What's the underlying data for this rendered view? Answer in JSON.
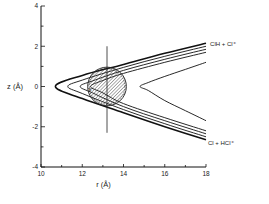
{
  "chart_data": {
    "type": "line",
    "title": "",
    "xlabel": "r (Å)",
    "ylabel": "z (Å)",
    "xlim": [
      10,
      18
    ],
    "ylim": [
      -4,
      4
    ],
    "grid": false,
    "x_ticks": [
      10,
      12,
      14,
      16,
      18
    ],
    "x_tick_labels": [
      "10",
      "12",
      "14",
      "16",
      "18"
    ],
    "x_minor_ticks": [
      11,
      13,
      15,
      17
    ],
    "y_ticks": [
      4,
      2,
      0,
      -2,
      -4
    ],
    "y_tick_labels": [
      "4",
      "2",
      "0",
      "-2",
      "-4"
    ],
    "y_minor_ticks": [
      3,
      1,
      -1,
      -3
    ],
    "series": [
      {
        "name": "contour-1",
        "tip_r": 10.7,
        "upper": [
          [
            10.7,
            0
          ],
          [
            12,
            0.55
          ],
          [
            14,
            1.1
          ],
          [
            16,
            1.65
          ],
          [
            18,
            2.15
          ]
        ],
        "lower": [
          [
            10.7,
            0
          ],
          [
            12,
            -0.6
          ],
          [
            14,
            -1.3
          ],
          [
            16,
            -2.0
          ],
          [
            18,
            -2.65
          ]
        ]
      },
      {
        "name": "contour-2",
        "tip_r": 11.3,
        "upper": [
          [
            11.3,
            0
          ],
          [
            12,
            0.32
          ],
          [
            14,
            0.95
          ],
          [
            16,
            1.5
          ],
          [
            18,
            2.0
          ]
        ],
        "lower": [
          [
            11.3,
            0
          ],
          [
            12,
            -0.35
          ],
          [
            14,
            -1.15
          ],
          [
            16,
            -1.85
          ],
          [
            18,
            -2.5
          ]
        ]
      },
      {
        "name": "contour-3",
        "tip_r": 11.9,
        "upper": [
          [
            11.9,
            0
          ],
          [
            12.5,
            0.28
          ],
          [
            14,
            0.8
          ],
          [
            16,
            1.35
          ],
          [
            18,
            1.85
          ]
        ],
        "lower": [
          [
            11.9,
            0
          ],
          [
            12.5,
            -0.32
          ],
          [
            14,
            -1.0
          ],
          [
            16,
            -1.7
          ],
          [
            18,
            -2.35
          ]
        ]
      },
      {
        "name": "contour-4",
        "tip_r": 12.4,
        "upper": [
          [
            12.4,
            0
          ],
          [
            13,
            0.3
          ],
          [
            14,
            0.65
          ],
          [
            16,
            1.2
          ],
          [
            18,
            1.7
          ]
        ],
        "lower": [
          [
            12.4,
            0
          ],
          [
            13,
            -0.32
          ],
          [
            14,
            -0.85
          ],
          [
            16,
            -1.55
          ],
          [
            18,
            -2.2
          ]
        ]
      },
      {
        "name": "contour-5",
        "tip_r": 14.8,
        "upper": [
          [
            14.8,
            0
          ],
          [
            15.2,
            0.2
          ],
          [
            16,
            0.5
          ],
          [
            17,
            0.85
          ],
          [
            18,
            1.2
          ]
        ],
        "lower": [
          [
            14.8,
            0
          ],
          [
            15.2,
            -0.2
          ],
          [
            16,
            -0.7
          ],
          [
            17,
            -1.2
          ],
          [
            18,
            -1.7
          ]
        ]
      }
    ],
    "annotations": [
      {
        "text": "ClH + Cl⁺",
        "r": 18.1,
        "z": 2.1,
        "position": "right of upper channel end"
      },
      {
        "text": "Cl + HCl⁺",
        "r": 18.0,
        "z": -2.8,
        "position": "right of lower channel end"
      },
      {
        "text": "x",
        "r": 12.3,
        "z": -0.1
      }
    ],
    "shaded_circle": {
      "center_r": 13.2,
      "center_z": 0.0,
      "radius": 0.95
    },
    "vertical_marker": {
      "r": 13.2,
      "z_from": 2.0,
      "z_to": -2.3
    }
  }
}
